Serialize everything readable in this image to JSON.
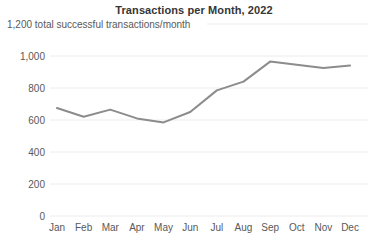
{
  "chart_data": {
    "type": "line",
    "title": "Transactions per Month, 2022",
    "subtitle": "1,200 total successful transactions/month",
    "categories": [
      "Jan",
      "Feb",
      "Mar",
      "Apr",
      "May",
      "Jun",
      "Jul",
      "Aug",
      "Sep",
      "Oct",
      "Nov",
      "Dec"
    ],
    "values": [
      675,
      620,
      665,
      610,
      585,
      650,
      785,
      840,
      965,
      945,
      925,
      940
    ],
    "xlabel": "",
    "ylabel": "",
    "ylim": [
      0,
      1200
    ],
    "yticks": [
      0,
      200,
      400,
      600,
      800,
      1000
    ],
    "ytick_labels": [
      "0",
      "200",
      "400",
      "600",
      "800",
      "1,000"
    ],
    "top_gridline_value": 1200,
    "grid": "horizontal",
    "legend": "none",
    "colors": {
      "line": "#8c8c8c",
      "grid": "#ececec",
      "labels": "#595959",
      "title": "#363636",
      "background": "#ffffff"
    }
  }
}
